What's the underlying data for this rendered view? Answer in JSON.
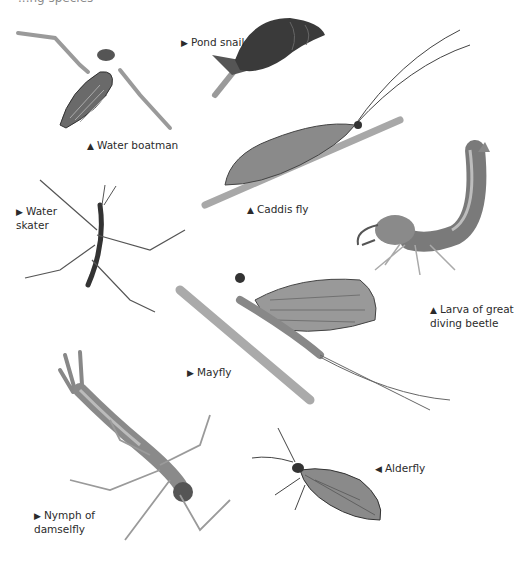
{
  "page": {
    "top_cropped_text": "...ng species",
    "figures": [
      {
        "id": "water-boatman",
        "label": "Water boatman",
        "pointer": "▲"
      },
      {
        "id": "pond-snail",
        "label": "Pond snail",
        "pointer": "▶"
      },
      {
        "id": "caddis-fly",
        "label": "Caddis fly",
        "pointer": "▲"
      },
      {
        "id": "water-skater",
        "label": "Water\nskater",
        "pointer": "▶"
      },
      {
        "id": "larva-great-diving-beetle",
        "label": "Larva of great\ndiving beetle",
        "pointer": "▲"
      },
      {
        "id": "mayfly",
        "label": "Mayfly",
        "pointer": "▶"
      },
      {
        "id": "alderfly",
        "label": "Alderfly",
        "pointer": "◀"
      },
      {
        "id": "nymph-damselfly",
        "label": "Nymph of\ndamselfly",
        "pointer": "▶"
      }
    ]
  },
  "colors": {
    "background": "#ffffff",
    "text": "#2b2b2b",
    "illustration_dark": "#3a3a3a",
    "illustration_mid": "#8c8c8c",
    "illustration_light": "#c8c8c8"
  }
}
